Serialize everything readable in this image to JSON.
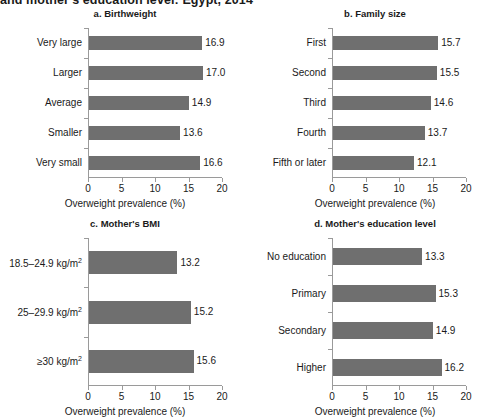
{
  "figure": {
    "main_title": "and mother's education level: Egypt, 2014",
    "bar_color": "#6f6f6f",
    "axis_color": "#9a9a9a",
    "background": "#ffffff"
  },
  "chart_data": [
    {
      "type": "bar",
      "orientation": "horizontal",
      "title": "a. Birthweight",
      "panel": "a",
      "xlabel": "Overweight prevalence (%)",
      "ylabel": "",
      "xlim": [
        0,
        20
      ],
      "xticks": [
        0,
        5,
        10,
        15,
        20
      ],
      "xticklabels": [
        "0",
        "5",
        "10",
        "15",
        "20"
      ],
      "grid": false,
      "legend": "none",
      "categories": [
        "Very large",
        "Larger",
        "Average",
        "Smaller",
        "Very small"
      ],
      "values": [
        16.9,
        17.0,
        14.9,
        13.6,
        16.6
      ],
      "value_labels": [
        "16.9",
        "17.0",
        "14.9",
        "13.6",
        "16.6"
      ]
    },
    {
      "type": "bar",
      "orientation": "horizontal",
      "title": "b. Family size",
      "panel": "b",
      "xlabel": "Overweight prevalence (%)",
      "ylabel": "",
      "xlim": [
        0,
        20
      ],
      "xticks": [
        0,
        5,
        10,
        15,
        20
      ],
      "xticklabels": [
        "0",
        "5",
        "10",
        "15",
        "20"
      ],
      "grid": false,
      "legend": "none",
      "categories": [
        "First",
        "Second",
        "Third",
        "Fourth",
        "Fifth or later"
      ],
      "values": [
        15.7,
        15.5,
        14.6,
        13.7,
        12.1
      ],
      "value_labels": [
        "15.7",
        "15.5",
        "14.6",
        "13.7",
        "12.1"
      ]
    },
    {
      "type": "bar",
      "orientation": "horizontal",
      "title": "c. Mother's BMI",
      "panel": "c",
      "xlabel": "Overweight prevalence (%)",
      "ylabel": "",
      "xlim": [
        0,
        20
      ],
      "xticks": [
        0,
        5,
        10,
        15,
        20
      ],
      "xticklabels": [
        "0",
        "5",
        "10",
        "15",
        "20"
      ],
      "grid": false,
      "legend": "none",
      "categories": [
        "18.5–24.9 kg/m²",
        "25–29.9 kg/m²",
        "≥30 kg/m²"
      ],
      "values": [
        13.2,
        15.2,
        15.6
      ],
      "value_labels": [
        "13.2",
        "15.2",
        "15.6"
      ]
    },
    {
      "type": "bar",
      "orientation": "horizontal",
      "title": "d. Mother's education level",
      "panel": "d",
      "xlabel": "Overweight prevalence (%)",
      "ylabel": "",
      "xlim": [
        0,
        20
      ],
      "xticks": [
        0,
        5,
        10,
        15,
        20
      ],
      "xticklabels": [
        "0",
        "5",
        "10",
        "15",
        "20"
      ],
      "grid": false,
      "legend": "none",
      "categories": [
        "No education",
        "Primary",
        "Secondary",
        "Higher"
      ],
      "values": [
        13.3,
        15.3,
        14.9,
        16.2
      ],
      "value_labels": [
        "13.3",
        "15.3",
        "14.9",
        "16.2"
      ]
    }
  ]
}
